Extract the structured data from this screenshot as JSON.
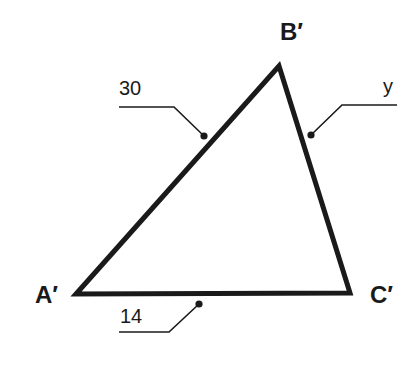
{
  "diagram": {
    "type": "triangle",
    "vertices": [
      {
        "id": "A",
        "label": "A′",
        "x": 76,
        "y": 294
      },
      {
        "id": "B",
        "label": "B′",
        "x": 279,
        "y": 66
      },
      {
        "id": "C",
        "label": "C′",
        "x": 350,
        "y": 293
      }
    ],
    "sides": [
      {
        "from": "A",
        "to": "B",
        "label": "30"
      },
      {
        "from": "B",
        "to": "C",
        "label": "y"
      },
      {
        "from": "A",
        "to": "C",
        "label": "14"
      }
    ],
    "colors": {
      "stroke": "#1a1a1a",
      "background": "#ffffff"
    }
  },
  "labels": {
    "vertex_a": "A′",
    "vertex_b": "B′",
    "vertex_c": "C′",
    "side_ab": "30",
    "side_bc": "y",
    "side_ac": "14"
  }
}
